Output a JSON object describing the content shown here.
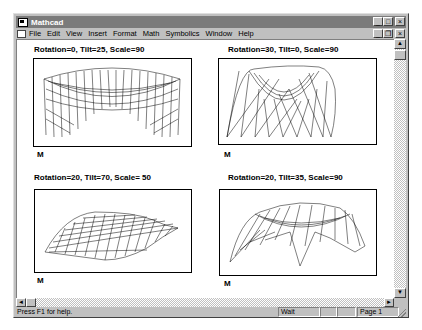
{
  "window": {
    "title": "Mathcad",
    "caption_buttons": [
      "minimize",
      "maximize",
      "close"
    ],
    "mdi_buttons": [
      "minimize",
      "restore",
      "close"
    ]
  },
  "menu": {
    "items": [
      {
        "label": "File",
        "accel": "F"
      },
      {
        "label": "Edit",
        "accel": "E"
      },
      {
        "label": "View",
        "accel": "V"
      },
      {
        "label": "Insert",
        "accel": "I"
      },
      {
        "label": "Format",
        "accel": "o"
      },
      {
        "label": "Math",
        "accel": "M"
      },
      {
        "label": "Symbolics",
        "accel": "S"
      },
      {
        "label": "Window",
        "accel": "W"
      },
      {
        "label": "Help",
        "accel": "H"
      }
    ]
  },
  "plots": [
    {
      "title": "Rotation=0, Tilt=25, Scale=90",
      "label": "M",
      "rotation": 0,
      "tilt": 25,
      "scale": 90
    },
    {
      "title": "Rotation=30, Tilt=0, Scale=90",
      "label": "M",
      "rotation": 30,
      "tilt": 0,
      "scale": 90
    },
    {
      "title": "Rotation=20, Tilt=70, Scale= 50",
      "label": "M",
      "rotation": 20,
      "tilt": 70,
      "scale": 50
    },
    {
      "title": "Rotation=20, Tilt=35, Scale=90",
      "label": "M",
      "rotation": 20,
      "tilt": 35,
      "scale": 90
    }
  ],
  "status": {
    "message": "Press F1 for help.",
    "mode": "Wait",
    "panel2": "",
    "panel3": "",
    "page": "Page 1"
  },
  "scroll": {
    "up": "▲",
    "down": "▼",
    "left": "◄",
    "right": "►"
  }
}
